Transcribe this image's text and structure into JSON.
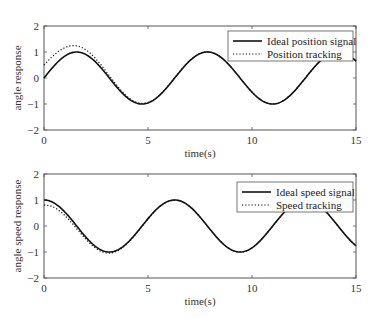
{
  "chart_data": [
    {
      "type": "line",
      "title": "",
      "xlabel": "time(s)",
      "ylabel": "angle response",
      "xlim": [
        0,
        15
      ],
      "ylim": [
        -2,
        2
      ],
      "xticks": [
        0,
        5,
        10,
        15
      ],
      "yticks": [
        -2,
        -1,
        0,
        1,
        2
      ],
      "grid": false,
      "legend_position": "upper right",
      "series": [
        {
          "name": "Ideal position signal",
          "style": "solid",
          "function": "sin(t)",
          "description": "y = sin(t), peaks ~1 at t≈1.57, 7.85; troughs ~-1 at t≈4.71, 11.0"
        },
        {
          "name": "Position tracking",
          "style": "dotted",
          "description": "starts ~0.5 at t=0, overshoots to ~1.25 at t≈1.4, converges to sin(t) after t≈4"
        }
      ],
      "sample_points": {
        "t": [
          0,
          1,
          1.57,
          2,
          3,
          4,
          4.71,
          6,
          7.85,
          9,
          11,
          13,
          15
        ],
        "ideal": [
          0,
          0.84,
          1.0,
          0.91,
          0.14,
          -0.76,
          -1.0,
          -0.28,
          1.0,
          0.41,
          -1.0,
          0.42,
          0.65
        ],
        "tracking": [
          0.5,
          1.15,
          1.25,
          1.1,
          0.3,
          -0.7,
          -0.98,
          -0.28,
          1.0,
          0.41,
          -1.0,
          0.42,
          0.65
        ]
      }
    },
    {
      "type": "line",
      "title": "",
      "xlabel": "time(s)",
      "ylabel": "angle speed response",
      "xlim": [
        0,
        15
      ],
      "ylim": [
        -2,
        2
      ],
      "xticks": [
        0,
        5,
        10,
        15
      ],
      "yticks": [
        -2,
        -1,
        0,
        1,
        2
      ],
      "grid": false,
      "legend_position": "upper right",
      "series": [
        {
          "name": "Ideal speed signal",
          "style": "solid",
          "function": "cos(t)",
          "description": "y = cos(t), starts at 1, trough -1 at t≈3.14, peak 1 at t≈6.28"
        },
        {
          "name": "Speed tracking",
          "style": "dotted",
          "description": "starts ~0.8 at t=0, slight undershoot near t≈3, converges to cos(t)"
        }
      ],
      "sample_points": {
        "t": [
          0,
          1,
          2,
          3.14,
          4,
          6.28,
          8,
          9.42,
          11,
          12.57,
          15
        ],
        "ideal": [
          1.0,
          0.54,
          -0.42,
          -1.0,
          -0.65,
          1.0,
          -0.15,
          -1.0,
          0.0,
          1.0,
          -0.76
        ],
        "tracking": [
          0.8,
          0.45,
          -0.45,
          -1.05,
          -0.66,
          1.0,
          -0.15,
          -1.0,
          0.0,
          1.0,
          -0.76
        ]
      }
    }
  ],
  "plots": {
    "top": {
      "ylabel": "angle response",
      "xlabel": "time(s)",
      "legend": [
        "Ideal position signal",
        "Position tracking"
      ],
      "yticks": [
        "2",
        "1",
        "0",
        "−1",
        "−2"
      ],
      "xticks": [
        "0",
        "5",
        "10",
        "15"
      ]
    },
    "bottom": {
      "ylabel": "angle speed response",
      "xlabel": "time(s)",
      "legend": [
        "Ideal speed signal",
        "Speed tracking"
      ],
      "yticks": [
        "2",
        "1",
        "0",
        "−1",
        "−2"
      ],
      "xticks": [
        "0",
        "5",
        "10",
        "15"
      ]
    }
  }
}
